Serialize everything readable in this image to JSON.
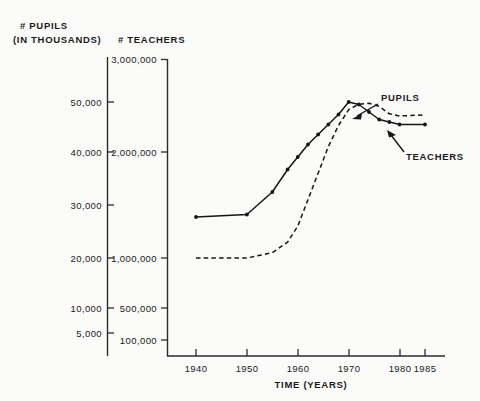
{
  "chart_data": {
    "type": "line",
    "title": "",
    "xlabel": "TIME (YEARS)",
    "ylabel_left": "# PUPILS (IN THOUSANDS)",
    "ylabel_right": "# TEACHERS",
    "grid": false,
    "legend_position": "inline-annotations",
    "xlim": [
      1940,
      1985
    ],
    "xticks": [
      1940,
      1950,
      1960,
      1970,
      1980,
      1985
    ],
    "xtick_labels": [
      "1940",
      "1950",
      "1960",
      "1970",
      "1980",
      "1985"
    ],
    "left_axis": {
      "name": "# PUPILS",
      "units": "(IN THOUSANDS)",
      "ticks": [
        5000,
        10000,
        20000,
        30000,
        40000,
        50000
      ],
      "tick_labels": [
        "5,000",
        "10,000",
        "20,000",
        "30,000",
        "40,000",
        "50,000"
      ],
      "ylim": [
        0,
        60000
      ]
    },
    "right_axis": {
      "name": "# TEACHERS",
      "ticks": [
        100000,
        500000,
        1000000,
        2000000,
        3000000
      ],
      "tick_labels": [
        "100,000",
        "500,000",
        "1,000,000",
        "2,000,000",
        "3,000,000"
      ],
      "ylim": [
        0,
        3000000
      ]
    },
    "series": [
      {
        "name": "PUPILS",
        "axis": "left",
        "style": "solid",
        "markers": true,
        "x": [
          1940,
          1950,
          1955,
          1958,
          1960,
          1962,
          1964,
          1966,
          1968,
          1970,
          1972,
          1974,
          1976,
          1978,
          1980,
          1985
        ],
        "values": [
          27000,
          27500,
          32000,
          36500,
          39000,
          41500,
          43500,
          45500,
          47500,
          50000,
          49500,
          48000,
          46500,
          46000,
          45500,
          45500
        ]
      },
      {
        "name": "TEACHERS",
        "axis": "right",
        "style": "dashed",
        "markers": false,
        "x": [
          1940,
          1950,
          1955,
          1958,
          1960,
          1962,
          1964,
          1966,
          1968,
          1970,
          1972,
          1974,
          1976,
          1978,
          1980,
          1985
        ],
        "values": [
          1000000,
          1000000,
          1050000,
          1150000,
          1300000,
          1550000,
          1800000,
          2050000,
          2250000,
          2400000,
          2450000,
          2460000,
          2430000,
          2360000,
          2340000,
          2350000
        ]
      }
    ],
    "annotations": [
      {
        "text": "PUPILS",
        "target_series": "PUPILS",
        "arrow": "down-left"
      },
      {
        "text": "TEACHERS",
        "target_series": "TEACHERS",
        "arrow": "up-left"
      }
    ]
  },
  "labels": {
    "pupils_header_line1": "# PUPILS",
    "pupils_header_line2": "(IN THOUSANDS)",
    "teachers_header": "# TEACHERS",
    "xaxis_title": "TIME (YEARS)",
    "series_pupils": "PUPILS",
    "series_teachers": "TEACHERS",
    "left_ticks": {
      "t50000": "50,000",
      "t40000": "40,000",
      "t30000": "30,000",
      "t20000": "20,000",
      "t10000": "10,000",
      "t5000": "5,000"
    },
    "right_ticks": {
      "t3000000": "3,000,000",
      "t2000000": "2,000,000",
      "t1000000": "1,000,000",
      "t500000": "500,000",
      "t100000": "100,000"
    },
    "xticks": {
      "x1940": "1940",
      "x1950": "1950",
      "x1960": "1960",
      "x1970": "1970",
      "x1980": "1980",
      "x1985": "1985"
    }
  },
  "colors": {
    "ink": "#161616",
    "axis": "#2b2b2b",
    "background": "#fbfbfa"
  }
}
